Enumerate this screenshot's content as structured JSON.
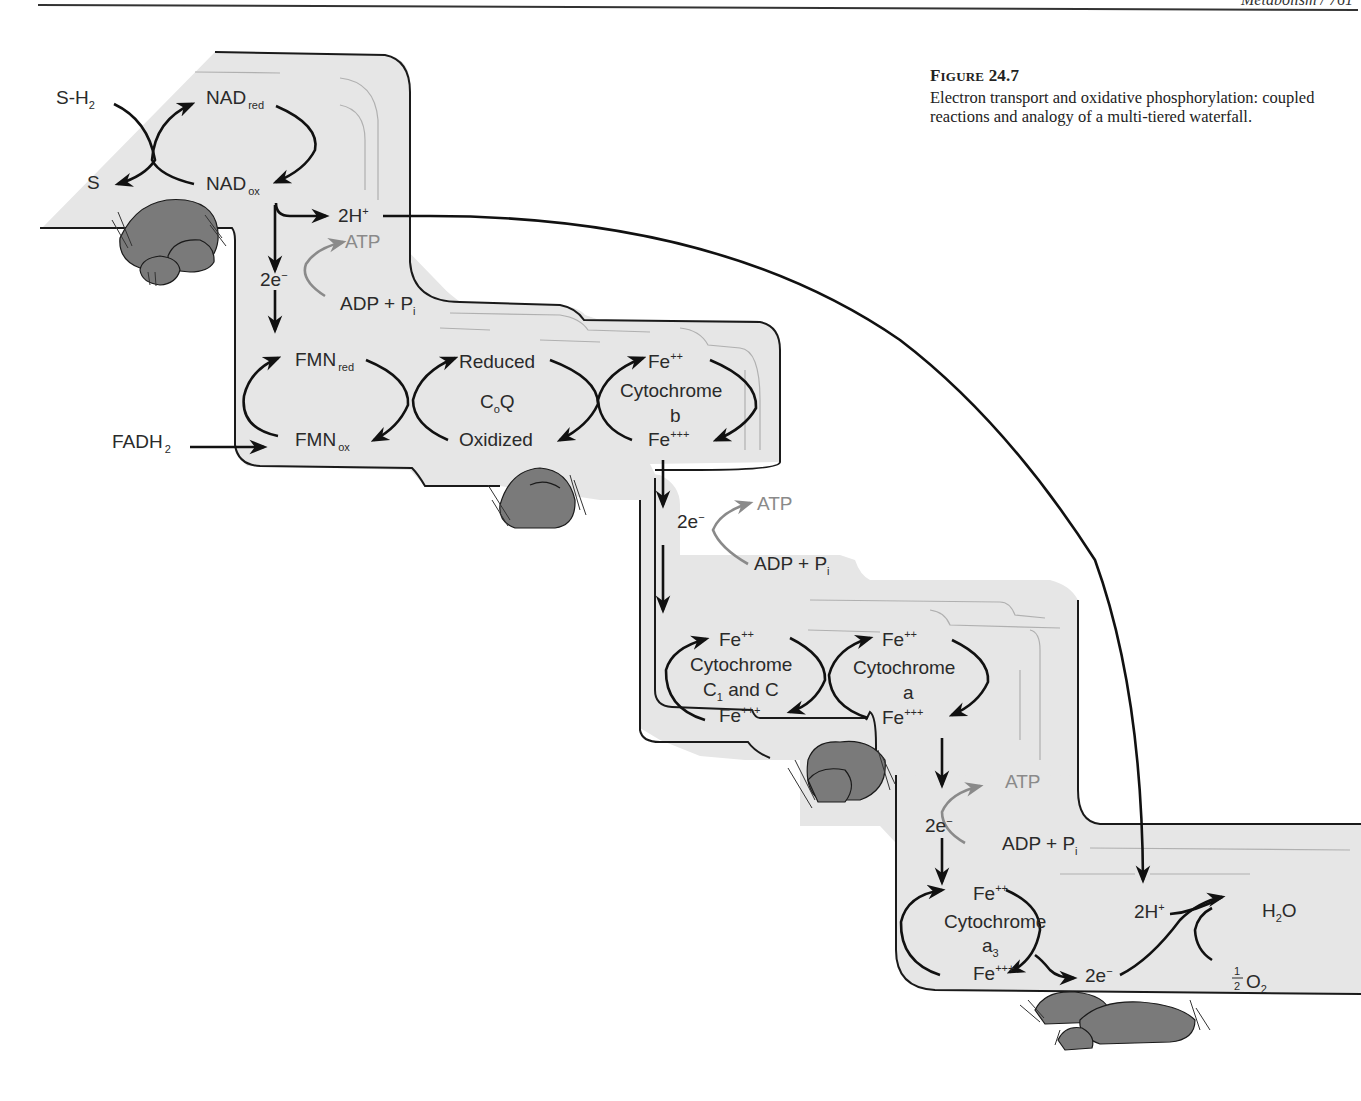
{
  "page_header": {
    "running_head": "Metabolism / 761"
  },
  "caption": {
    "figure_label_prefix": "F",
    "figure_label_rest": "IGURE",
    "figure_number": "24.7",
    "text": "Electron transport and oxidative phosphorylation: coupled reactions and analogy of a multi-tiered waterfall."
  },
  "colors": {
    "water_fill": "#e6e6e6",
    "outline": "#1a1a1a",
    "rock_fill": "#7a7a7a",
    "atp_gray": "#8a8a8a",
    "text": "#2a2a2a"
  },
  "tier1": {
    "substrate_reduced": "S-H",
    "substrate_reduced_sub": "2",
    "substrate_oxidized": "S",
    "nad_red": "NAD",
    "nad_red_sub": "red",
    "nad_ox": "NAD",
    "nad_ox_sub": "ox",
    "protons": "2H",
    "protons_sup": "+",
    "atp": "ATP",
    "electrons": "2e",
    "electrons_sup": "−",
    "adp": "ADP + P",
    "adp_sub": "i"
  },
  "tier2": {
    "fadh2": "FADH",
    "fadh2_sub": "2",
    "fmn_red": "FMN",
    "fmn_red_sub": "red",
    "fmn_ox": "FMN",
    "fmn_ox_sub": "ox",
    "coq_reduced": "Reduced",
    "coq_name": "C",
    "coq_name_sub": "o",
    "coq_name_end": "Q",
    "coq_oxidized": "Oxidized",
    "cyt_b_top": "Fe",
    "cyt_b_top_sup": "++",
    "cyt_b_name": "Cytochrome",
    "cyt_b_letter": "b",
    "cyt_b_bottom": "Fe",
    "cyt_b_bottom_sup": "+++",
    "atp": "ATP",
    "electrons": "2e",
    "electrons_sup": "−",
    "adp": "ADP + P",
    "adp_sub": "i"
  },
  "tier3": {
    "cyt_c_top": "Fe",
    "cyt_c_top_sup": "++",
    "cyt_c_name": "Cytochrome",
    "cyt_c_letter_a": "C",
    "cyt_c_letter_a_sub": "1",
    "cyt_c_letter_b": " and C",
    "cyt_c_bottom": "Fe",
    "cyt_c_bottom_sup": "+++",
    "cyt_a_top": "Fe",
    "cyt_a_top_sup": "++",
    "cyt_a_name": "Cytochrome",
    "cyt_a_letter": "a",
    "cyt_a_bottom": "Fe",
    "cyt_a_bottom_sup": "+++",
    "atp": "ATP",
    "electrons": "2e",
    "electrons_sup": "−",
    "adp": "ADP + P",
    "adp_sub": "i"
  },
  "tier4": {
    "cyt_a3_top": "Fe",
    "cyt_a3_top_sup": "++",
    "cyt_a3_name": "Cytochrome",
    "cyt_a3_letter": "a",
    "cyt_a3_letter_sub": "3",
    "cyt_a3_bottom": "Fe",
    "cyt_a3_bottom_sup": "+++",
    "protons": "2H",
    "protons_sup": "+",
    "electrons": "2e",
    "electrons_sup": "−",
    "water": "H",
    "water_sub": "2",
    "water_end": "O",
    "oxygen_num": "1",
    "oxygen_den": "2",
    "oxygen": "O",
    "oxygen_sub": "2"
  }
}
